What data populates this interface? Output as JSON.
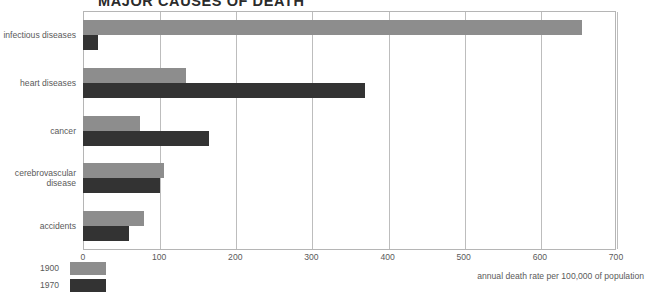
{
  "chart_data": {
    "type": "bar",
    "orientation": "horizontal",
    "title": "MAJOR CAUSES OF DEATH",
    "xlabel": "annual death rate per 100,000 of population",
    "ylabel": "",
    "xlim": [
      0,
      700
    ],
    "xticks": [
      0,
      100,
      200,
      300,
      400,
      500,
      600,
      700
    ],
    "xtick_labels": [
      "0",
      "100",
      "200",
      "300",
      "400",
      "500",
      "600",
      "700"
    ],
    "grid": true,
    "grid_axis": "x",
    "legend_position": "bottom-left",
    "categories": [
      "infectious diseases",
      "heart diseases",
      "cancer",
      "cerebrovascular disease",
      "accidents"
    ],
    "series": [
      {
        "name": "1900",
        "color": "#8d8d8d",
        "values": [
          655,
          135,
          75,
          107,
          80
        ]
      },
      {
        "name": "1970",
        "color": "#333333",
        "values": [
          20,
          370,
          165,
          101,
          60
        ]
      }
    ]
  },
  "legend": {
    "items": [
      {
        "label": "1900",
        "color_key": "s1900"
      },
      {
        "label": "1970",
        "color_key": "s1970"
      }
    ]
  },
  "colors": {
    "series_1900": "#8d8d8d",
    "series_1970": "#333333",
    "frame": "#b5b5b5",
    "gridline": "#bdbdbd",
    "text": "#5a5a5a",
    "title": "#2b2b2b",
    "background": "#ffffff"
  }
}
